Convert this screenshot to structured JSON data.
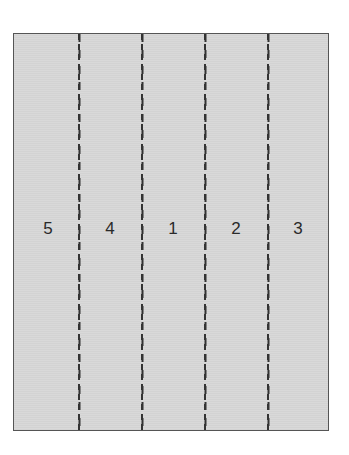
{
  "diagram": {
    "type": "fold-panel-layout",
    "panel_count": 5,
    "panels": [
      {
        "label": "5",
        "center_x": 34
      },
      {
        "label": "4",
        "center_x": 96
      },
      {
        "label": "1",
        "center_x": 159
      },
      {
        "label": "2",
        "center_x": 222
      },
      {
        "label": "3",
        "center_x": 284
      }
    ],
    "fold_lines_x": [
      65,
      128,
      191,
      254
    ],
    "colors": {
      "panel_fill": "#d6d6d6",
      "border": "#555555",
      "fold_line": "#333333",
      "label": "#2a2a2a"
    }
  }
}
